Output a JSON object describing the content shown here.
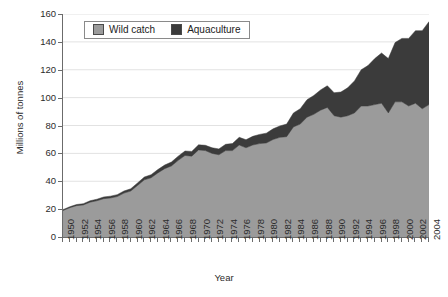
{
  "chart_data": {
    "type": "area",
    "stacked": true,
    "title": "",
    "xlabel": "Year",
    "ylabel": "Millions of tonnes",
    "ylim": [
      0,
      160
    ],
    "y_ticks": [
      0,
      20,
      40,
      60,
      80,
      100,
      120,
      140,
      160
    ],
    "grid": true,
    "grid_axis": "y",
    "legend_position": "top-center",
    "x_tick_labels": [
      "1950",
      "1952",
      "1954",
      "1956",
      "1958",
      "1960",
      "1962",
      "1964",
      "1966",
      "1968",
      "1970",
      "1972",
      "1974",
      "1976",
      "1978",
      "1980",
      "1982",
      "1984",
      "1986",
      "1988",
      "1990",
      "1992",
      "1994",
      "1996",
      "1998",
      "2000",
      "2002",
      "2004"
    ],
    "x": [
      1950,
      1951,
      1952,
      1953,
      1954,
      1955,
      1956,
      1957,
      1958,
      1959,
      1960,
      1961,
      1962,
      1963,
      1964,
      1965,
      1966,
      1967,
      1968,
      1969,
      1970,
      1971,
      1972,
      1973,
      1974,
      1975,
      1976,
      1977,
      1978,
      1979,
      1980,
      1981,
      1982,
      1983,
      1984,
      1985,
      1986,
      1987,
      1988,
      1989,
      1990,
      1991,
      1992,
      1993,
      1994,
      1995,
      1996,
      1997,
      1998,
      1999,
      2000,
      2001,
      2002,
      2003,
      2004
    ],
    "series": [
      {
        "name": "Wild catch",
        "color": "#9b9b9b",
        "values": [
          19,
          21,
          22.5,
          23,
          25,
          26,
          27.5,
          28,
          29,
          31.5,
          33,
          37,
          41,
          42.5,
          46,
          49,
          51,
          55,
          58.5,
          58,
          62.5,
          62,
          60,
          59,
          62,
          62,
          66,
          64,
          66,
          67,
          67.5,
          70,
          71.5,
          72,
          79,
          81,
          86,
          88,
          91,
          93,
          87,
          86,
          87,
          89,
          94,
          94,
          95,
          96,
          89,
          97,
          97,
          94,
          96,
          92,
          95
        ]
      },
      {
        "name": "Aquaculture",
        "color": "#3b3b3b",
        "values": [
          0.6,
          0.7,
          0.8,
          0.9,
          1.0,
          1.1,
          1.2,
          1.3,
          1.4,
          1.5,
          1.6,
          1.8,
          2.0,
          2.2,
          2.4,
          2.6,
          2.8,
          3.0,
          3.2,
          3.4,
          3.6,
          3.8,
          4.0,
          4.2,
          4.5,
          5.0,
          5.5,
          5.8,
          6.2,
          6.6,
          7.0,
          7.6,
          8.2,
          9.0,
          10.0,
          11.0,
          12.5,
          13.5,
          14.5,
          15.5,
          16.5,
          18.0,
          20.0,
          23.0,
          26.0,
          29.0,
          33.0,
          36.0,
          39.0,
          42.5,
          45.5,
          48.5,
          52.0,
          56.0,
          59.5
        ]
      }
    ]
  },
  "legend": {
    "items": [
      {
        "label": "Wild catch",
        "color": "#9b9b9b"
      },
      {
        "label": "Aquaculture",
        "color": "#3b3b3b"
      }
    ]
  },
  "axes": {
    "y_title": "Millions of tonnes",
    "x_title": "Year"
  }
}
